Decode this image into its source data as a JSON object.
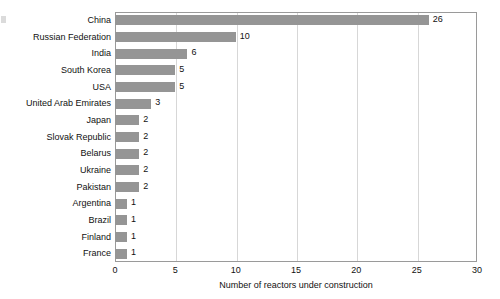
{
  "chart_data": {
    "type": "bar",
    "orientation": "horizontal",
    "title": "",
    "xlabel": "Number of reactors under construction",
    "ylabel": "",
    "xlim": [
      0,
      30
    ],
    "xticks": [
      0,
      5,
      10,
      15,
      20,
      25,
      30
    ],
    "xtick_labels": [
      "0",
      "5",
      "10",
      "15",
      "20",
      "25",
      "30"
    ],
    "grid": "vertical",
    "legend": "none",
    "bar_color": "#959595",
    "categories": [
      "China",
      "Russian Federation",
      "India",
      "South Korea",
      "USA",
      "United Arab Emirates",
      "Japan",
      "Slovak Republic",
      "Belarus",
      "Ukraine",
      "Pakistan",
      "Argentina",
      "Brazil",
      "Finland",
      "France"
    ],
    "values": [
      26,
      10,
      6,
      5,
      5,
      3,
      2,
      2,
      2,
      2,
      2,
      1,
      1,
      1,
      1
    ],
    "data_labels": [
      "26",
      "10",
      "6",
      "5",
      "5",
      "3",
      "2",
      "2",
      "2",
      "2",
      "2",
      "1",
      "1",
      "1",
      "1"
    ]
  }
}
